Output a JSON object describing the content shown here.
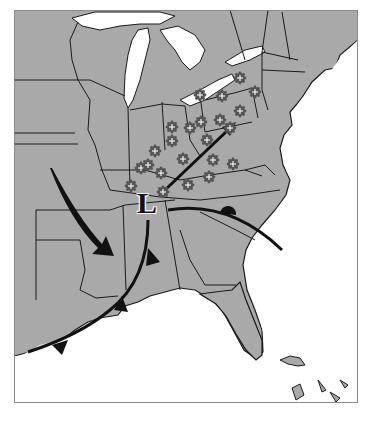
{
  "map": {
    "type": "weather-map",
    "region": "Eastern United States",
    "colors": {
      "land": "#a9a9a9",
      "water": "#ffffff",
      "borders": "#1a1a1a",
      "fronts": "#111111",
      "frame": "#8a8a8a"
    },
    "low_pressure": {
      "label": "L",
      "x": 148,
      "y": 192
    },
    "fronts": [
      {
        "kind": "cold-front",
        "description": "from low southwest through Mississippi/Alabama to Gulf"
      },
      {
        "kind": "warm-front",
        "description": "from low east-southeast across the Carolinas"
      }
    ],
    "arrows": [
      {
        "name": "northwest-flow-arrow",
        "description": "curved arrow from Missouri to Arkansas/Mississippi"
      },
      {
        "name": "northeast-flow-arrow",
        "description": "straight arrow from Tennessee toward Pennsylvania"
      }
    ],
    "snow_symbols": [
      {
        "x": 240,
        "y": 78
      },
      {
        "x": 222,
        "y": 96
      },
      {
        "x": 255,
        "y": 92
      },
      {
        "x": 200,
        "y": 95
      },
      {
        "x": 240,
        "y": 111
      },
      {
        "x": 220,
        "y": 120
      },
      {
        "x": 201,
        "y": 122
      },
      {
        "x": 172,
        "y": 127
      },
      {
        "x": 190,
        "y": 128
      },
      {
        "x": 172,
        "y": 141
      },
      {
        "x": 207,
        "y": 140
      },
      {
        "x": 230,
        "y": 128
      },
      {
        "x": 155,
        "y": 151
      },
      {
        "x": 183,
        "y": 159
      },
      {
        "x": 213,
        "y": 160
      },
      {
        "x": 233,
        "y": 164
      },
      {
        "x": 141,
        "y": 168
      },
      {
        "x": 161,
        "y": 173
      },
      {
        "x": 209,
        "y": 177
      },
      {
        "x": 188,
        "y": 185
      },
      {
        "x": 131,
        "y": 186
      },
      {
        "x": 163,
        "y": 192
      },
      {
        "x": 148,
        "y": 165
      }
    ]
  }
}
